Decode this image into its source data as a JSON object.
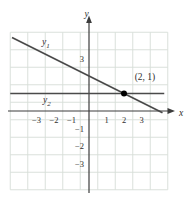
{
  "figure": {
    "background": "#ffffff",
    "axis_label_x": "x",
    "axis_label_y": "y",
    "line1_label": {
      "base": "y",
      "sub": "1"
    },
    "line2_label": {
      "base": "y",
      "sub": "2"
    },
    "point_label": "(2, 1)",
    "colors": {
      "grid": "#d6ddd7",
      "axis": "#3c3c3c",
      "line": "#4a4a4a",
      "point": "#000000",
      "text": "#2f2f2f"
    }
  },
  "chart_data": {
    "type": "line",
    "title": "",
    "xlabel": "x",
    "ylabel": "y",
    "xlim": [
      -4.5,
      4.5
    ],
    "ylim": [
      -4.5,
      4.5
    ],
    "grid": true,
    "grid_style": "light squares offset between integer ticks",
    "x_tick_values": [
      -3,
      -2,
      -1,
      1,
      2,
      3
    ],
    "x_tick_labels": [
      "−3",
      "−2",
      "−1",
      "1",
      "2",
      "3"
    ],
    "y_tick_values": [
      3,
      -1,
      -2,
      -3
    ],
    "y_tick_labels": [
      "3",
      "−1",
      "−2",
      "−3"
    ],
    "series": [
      {
        "name": "y1",
        "equation": "y1 = -(1/2)x + 2",
        "slope": -0.5,
        "y_intercept": 2,
        "points": [
          [
            -4.4,
            4.2
          ],
          [
            0,
            2
          ],
          [
            2,
            1
          ],
          [
            4.2,
            -0.1
          ]
        ]
      },
      {
        "name": "y2",
        "equation": "y2 = 1",
        "points": [
          [
            -4.5,
            1
          ],
          [
            4.3,
            1
          ]
        ]
      }
    ],
    "intersection_point": {
      "x": 2,
      "y": 1,
      "label": "(2, 1)"
    },
    "legend": "none"
  }
}
